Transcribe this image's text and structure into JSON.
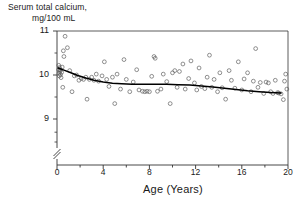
{
  "chart_data": {
    "type": "scatter",
    "title": "",
    "ylabel_line1": "Serum total calcium,",
    "ylabel_line2": "mg/100 mL",
    "xlabel": "Age (Years)",
    "xlim": [
      0,
      20
    ],
    "ylim": [
      8.55,
      11.0
    ],
    "axis_break": true,
    "axis_break_note": "y-axis broken below 8.7 down to baseline",
    "grid": false,
    "legend": null,
    "yticks": [
      9,
      10,
      11
    ],
    "yticklabels": [
      "9",
      "10",
      "11"
    ],
    "yminorticks": [
      8.7,
      9.5,
      10.5
    ],
    "xticks": [
      0,
      2,
      4,
      6,
      8,
      10,
      12,
      14,
      16,
      18,
      20
    ],
    "xticklabels": [
      "0",
      "4",
      "8",
      "12",
      "16",
      "20"
    ],
    "xlabeled_ticks": [
      0,
      4,
      8,
      12,
      16,
      20
    ],
    "marker": "open-circle",
    "marker_color": "#555555",
    "curve_color": "#000000",
    "curve_label": "fitted smooth trend",
    "curve": [
      {
        "x": 0.1,
        "y": 10.16
      },
      {
        "x": 0.6,
        "y": 10.11
      },
      {
        "x": 1.2,
        "y": 10.05
      },
      {
        "x": 1.8,
        "y": 9.99
      },
      {
        "x": 2.5,
        "y": 9.93
      },
      {
        "x": 3.2,
        "y": 9.88
      },
      {
        "x": 4.0,
        "y": 9.84
      },
      {
        "x": 4.8,
        "y": 9.81
      },
      {
        "x": 5.6,
        "y": 9.8
      },
      {
        "x": 6.5,
        "y": 9.79
      },
      {
        "x": 7.5,
        "y": 9.79
      },
      {
        "x": 8.5,
        "y": 9.79
      },
      {
        "x": 9.5,
        "y": 9.79
      },
      {
        "x": 10.5,
        "y": 9.78
      },
      {
        "x": 11.5,
        "y": 9.77
      },
      {
        "x": 12.5,
        "y": 9.75
      },
      {
        "x": 13.5,
        "y": 9.73
      },
      {
        "x": 14.5,
        "y": 9.7
      },
      {
        "x": 15.5,
        "y": 9.67
      },
      {
        "x": 16.5,
        "y": 9.64
      },
      {
        "x": 17.5,
        "y": 9.62
      },
      {
        "x": 18.5,
        "y": 9.6
      },
      {
        "x": 19.4,
        "y": 9.59
      }
    ],
    "points": [
      {
        "x": 0.15,
        "y": 10.22
      },
      {
        "x": 0.15,
        "y": 10.12
      },
      {
        "x": 0.18,
        "y": 10.04
      },
      {
        "x": 0.2,
        "y": 9.98
      },
      {
        "x": 0.22,
        "y": 10.17
      },
      {
        "x": 0.25,
        "y": 10.08
      },
      {
        "x": 0.3,
        "y": 10.01
      },
      {
        "x": 0.3,
        "y": 10.12
      },
      {
        "x": 0.35,
        "y": 9.94
      },
      {
        "x": 0.4,
        "y": 10.06
      },
      {
        "x": 0.45,
        "y": 10.18
      },
      {
        "x": 0.5,
        "y": 9.72
      },
      {
        "x": 0.55,
        "y": 10.55
      },
      {
        "x": 0.6,
        "y": 10.42
      },
      {
        "x": 0.7,
        "y": 10.88
      },
      {
        "x": 0.9,
        "y": 10.62
      },
      {
        "x": 1.1,
        "y": 10.1
      },
      {
        "x": 1.3,
        "y": 9.62
      },
      {
        "x": 1.5,
        "y": 9.98
      },
      {
        "x": 1.7,
        "y": 10.0
      },
      {
        "x": 1.9,
        "y": 9.88
      },
      {
        "x": 2.1,
        "y": 9.92
      },
      {
        "x": 2.3,
        "y": 9.9
      },
      {
        "x": 2.5,
        "y": 9.95
      },
      {
        "x": 2.6,
        "y": 9.45
      },
      {
        "x": 2.8,
        "y": 9.9
      },
      {
        "x": 3.0,
        "y": 9.95
      },
      {
        "x": 3.2,
        "y": 9.88
      },
      {
        "x": 3.4,
        "y": 10.02
      },
      {
        "x": 3.6,
        "y": 9.86
      },
      {
        "x": 3.9,
        "y": 9.98
      },
      {
        "x": 4.1,
        "y": 10.3
      },
      {
        "x": 4.3,
        "y": 9.9
      },
      {
        "x": 4.5,
        "y": 9.74
      },
      {
        "x": 4.8,
        "y": 9.95
      },
      {
        "x": 5.0,
        "y": 9.35
      },
      {
        "x": 5.2,
        "y": 10.02
      },
      {
        "x": 5.5,
        "y": 9.68
      },
      {
        "x": 5.8,
        "y": 10.35
      },
      {
        "x": 6.0,
        "y": 9.9
      },
      {
        "x": 6.3,
        "y": 9.62
      },
      {
        "x": 6.6,
        "y": 9.84
      },
      {
        "x": 6.9,
        "y": 10.12
      },
      {
        "x": 7.1,
        "y": 9.66
      },
      {
        "x": 7.4,
        "y": 9.63
      },
      {
        "x": 7.6,
        "y": 9.62
      },
      {
        "x": 7.8,
        "y": 9.63
      },
      {
        "x": 8.0,
        "y": 9.62
      },
      {
        "x": 8.2,
        "y": 9.97
      },
      {
        "x": 8.4,
        "y": 10.42
      },
      {
        "x": 8.5,
        "y": 10.38
      },
      {
        "x": 8.7,
        "y": 9.63
      },
      {
        "x": 9.0,
        "y": 9.68
      },
      {
        "x": 9.2,
        "y": 10.02
      },
      {
        "x": 9.5,
        "y": 9.85
      },
      {
        "x": 9.8,
        "y": 9.35
      },
      {
        "x": 10.0,
        "y": 10.05
      },
      {
        "x": 10.2,
        "y": 10.1
      },
      {
        "x": 10.4,
        "y": 9.72
      },
      {
        "x": 10.6,
        "y": 10.08
      },
      {
        "x": 10.9,
        "y": 10.25
      },
      {
        "x": 11.1,
        "y": 9.68
      },
      {
        "x": 11.4,
        "y": 9.92
      },
      {
        "x": 11.6,
        "y": 10.32
      },
      {
        "x": 11.9,
        "y": 9.82
      },
      {
        "x": 12.1,
        "y": 9.66
      },
      {
        "x": 12.3,
        "y": 10.16
      },
      {
        "x": 12.5,
        "y": 9.74
      },
      {
        "x": 12.8,
        "y": 9.69
      },
      {
        "x": 13.0,
        "y": 9.95
      },
      {
        "x": 13.2,
        "y": 10.45
      },
      {
        "x": 13.4,
        "y": 9.72
      },
      {
        "x": 13.6,
        "y": 9.9
      },
      {
        "x": 13.9,
        "y": 9.62
      },
      {
        "x": 14.1,
        "y": 10.05
      },
      {
        "x": 14.3,
        "y": 9.71
      },
      {
        "x": 14.6,
        "y": 9.45
      },
      {
        "x": 14.9,
        "y": 10.1
      },
      {
        "x": 15.1,
        "y": 9.88
      },
      {
        "x": 15.4,
        "y": 9.7
      },
      {
        "x": 15.7,
        "y": 10.3
      },
      {
        "x": 16.0,
        "y": 9.66
      },
      {
        "x": 16.2,
        "y": 9.91
      },
      {
        "x": 16.5,
        "y": 10.05
      },
      {
        "x": 16.8,
        "y": 9.62
      },
      {
        "x": 17.0,
        "y": 9.86
      },
      {
        "x": 17.2,
        "y": 10.6
      },
      {
        "x": 17.4,
        "y": 9.72
      },
      {
        "x": 17.6,
        "y": 9.83
      },
      {
        "x": 17.9,
        "y": 9.58
      },
      {
        "x": 18.1,
        "y": 9.84
      },
      {
        "x": 18.3,
        "y": 9.82
      },
      {
        "x": 18.5,
        "y": 9.62
      },
      {
        "x": 18.7,
        "y": 9.58
      },
      {
        "x": 18.9,
        "y": 9.88
      },
      {
        "x": 19.1,
        "y": 9.6
      },
      {
        "x": 19.2,
        "y": 9.59
      },
      {
        "x": 19.4,
        "y": 9.57
      },
      {
        "x": 19.6,
        "y": 9.44
      },
      {
        "x": 19.7,
        "y": 9.86
      },
      {
        "x": 19.8,
        "y": 10.02
      },
      {
        "x": 19.9,
        "y": 9.68
      }
    ]
  }
}
